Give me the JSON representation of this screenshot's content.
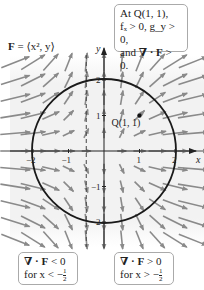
{
  "annotations": {
    "field_label": {
      "bold": "F",
      "rest": " = ⟨x², y⟩"
    },
    "top_box": {
      "line1": "At Q(1, 1),",
      "line2": "fₓ > 0, g_y > 0,",
      "line3_prefix": "and ",
      "line3_bold": "∇ · F",
      "line3_suffix": " > 0."
    },
    "bottom_left_box": {
      "line1_bold": "∇ · F",
      "line1_suffix": " < 0",
      "line2_prefix": "for x < −",
      "frac_num": "1",
      "frac_den": "2"
    },
    "bottom_right_box": {
      "line1_bold": "∇ · F",
      "line1_suffix": " > 0",
      "line2_prefix": "for x > −",
      "frac_num": "1",
      "frac_den": "2"
    },
    "point_label": "Q(1, 1)",
    "x_axis_label": "x",
    "y_axis_label": "y"
  },
  "chart_data": {
    "type": "vector_field",
    "title": "F = ⟨x², y⟩",
    "field": {
      "P": "x^2",
      "Q": "y"
    },
    "circle": {
      "center": [
        0,
        0
      ],
      "radius": 2
    },
    "point": {
      "label": "Q(1, 1)",
      "x": 1,
      "y": 1
    },
    "dashed_line_x": -0.5,
    "x_ticks": [
      -2,
      -1,
      1,
      2
    ],
    "y_ticks": [
      -2,
      -1,
      1,
      2
    ],
    "x_tick_labels": [
      "−2",
      "−1",
      "1",
      "2"
    ],
    "y_tick_labels": [
      "−2",
      "−1",
      "1",
      "2"
    ],
    "xlim": [
      -2.9,
      2.9
    ],
    "ylim": [
      -2.7,
      2.9
    ],
    "grid_x": [
      -2.5,
      -2,
      -1.5,
      -1,
      -0.5,
      0,
      0.5,
      1,
      1.5,
      2,
      2.5
    ],
    "grid_y": [
      -2.5,
      -2,
      -1.5,
      -1,
      -0.5,
      0,
      0.5,
      1,
      1.5,
      2,
      2.5
    ],
    "colors": {
      "arrow": "#8a8a8a",
      "axis": "#222222",
      "circle": "#1a1a1a",
      "shade": "#f0f0f0",
      "box_border": "#aaaaaa"
    }
  }
}
